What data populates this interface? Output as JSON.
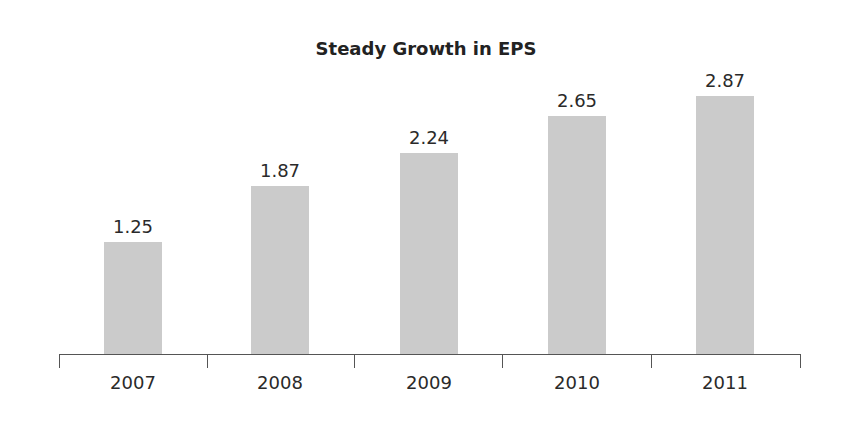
{
  "chart_data": {
    "type": "bar",
    "title": "Steady Growth in EPS",
    "categories": [
      "2007",
      "2008",
      "2009",
      "2010",
      "2011"
    ],
    "values": [
      1.25,
      1.87,
      2.24,
      2.65,
      2.87
    ],
    "value_labels": [
      "1.25",
      "1.87",
      "2.24",
      "2.65",
      "2.87"
    ],
    "xlabel": "",
    "ylabel": "",
    "ylim": [
      0,
      3.1
    ],
    "grid": false,
    "legend": null,
    "bar_color": "#cbcbcb"
  }
}
